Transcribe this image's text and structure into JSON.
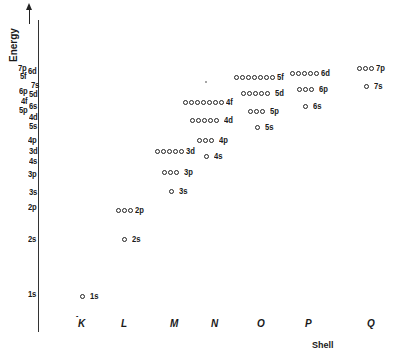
{
  "diagram": {
    "y_axis": {
      "label": "Energy",
      "arrow": "up-arrow-icon",
      "ticks": [
        {
          "label": "7p",
          "y": 68,
          "x": 18
        },
        {
          "label": "6d",
          "y": 71,
          "x": 28
        },
        {
          "label": "5f",
          "y": 76,
          "x": 20
        },
        {
          "label": "7s",
          "y": 85,
          "x": 31
        },
        {
          "label": "6p",
          "y": 91,
          "x": 19
        },
        {
          "label": "5d",
          "y": 94,
          "x": 29
        },
        {
          "label": "4f",
          "y": 101,
          "x": 21
        },
        {
          "label": "6s",
          "y": 106,
          "x": 29
        },
        {
          "label": "5p",
          "y": 110,
          "x": 19
        },
        {
          "label": "4d",
          "y": 117,
          "x": 29
        },
        {
          "label": "5s",
          "y": 126,
          "x": 29
        },
        {
          "label": "4p",
          "y": 140,
          "x": 28
        },
        {
          "label": "3d",
          "y": 151,
          "x": 29
        },
        {
          "label": "4s",
          "y": 161,
          "x": 29
        },
        {
          "label": "3p",
          "y": 174,
          "x": 28
        },
        {
          "label": "3s",
          "y": 192,
          "x": 29
        },
        {
          "label": "2p",
          "y": 207,
          "x": 28
        },
        {
          "label": "2s",
          "y": 239,
          "x": 28
        },
        {
          "label": "1s",
          "y": 294,
          "x": 28
        }
      ]
    },
    "x_axis": {
      "label": "Shell",
      "shells": [
        {
          "label": "K",
          "x": 78,
          "prefix": "-"
        },
        {
          "label": "L",
          "x": 121
        },
        {
          "label": "M",
          "x": 170
        },
        {
          "label": "N",
          "x": 211
        },
        {
          "label": "O",
          "x": 257
        },
        {
          "label": "P",
          "x": 305
        },
        {
          "label": "Q",
          "x": 367
        }
      ]
    },
    "orbitals": [
      {
        "label": "1s",
        "count": 1,
        "x": 80,
        "y": 296,
        "tight": false
      },
      {
        "label": "2s",
        "count": 1,
        "x": 122,
        "y": 239,
        "tight": false
      },
      {
        "label": "2p",
        "count": 3,
        "x": 116,
        "y": 210,
        "tight": true
      },
      {
        "label": "3s",
        "count": 1,
        "x": 169,
        "y": 191,
        "tight": false
      },
      {
        "label": "3p",
        "count": 3,
        "x": 162,
        "y": 172,
        "tight": false
      },
      {
        "label": "3d",
        "count": 5,
        "x": 155,
        "y": 151,
        "tight": true
      },
      {
        "label": "4s",
        "count": 1,
        "x": 204,
        "y": 156,
        "tight": false
      },
      {
        "label": "4p",
        "count": 3,
        "x": 197,
        "y": 140,
        "tight": false
      },
      {
        "label": "4d",
        "count": 5,
        "x": 190,
        "y": 120,
        "tight": false
      },
      {
        "label": "4f",
        "count": 7,
        "x": 183,
        "y": 102,
        "tight": true
      },
      {
        "label": "5s",
        "count": 1,
        "x": 255,
        "y": 127,
        "tight": false
      },
      {
        "label": "5p",
        "count": 3,
        "x": 248,
        "y": 111,
        "tight": false
      },
      {
        "label": "5d",
        "count": 5,
        "x": 241,
        "y": 93,
        "tight": false
      },
      {
        "label": "5f",
        "count": 7,
        "x": 234,
        "y": 77,
        "tight": true
      },
      {
        "label": "6s",
        "count": 1,
        "x": 303,
        "y": 106,
        "tight": false
      },
      {
        "label": "6p",
        "count": 3,
        "x": 297,
        "y": 89,
        "tight": false
      },
      {
        "label": "6d",
        "count": 5,
        "x": 290,
        "y": 73,
        "tight": true
      },
      {
        "label": "7s",
        "count": 1,
        "x": 364,
        "y": 86,
        "tight": false
      },
      {
        "label": "7p",
        "count": 3,
        "x": 357,
        "y": 68,
        "tight": true
      }
    ]
  }
}
